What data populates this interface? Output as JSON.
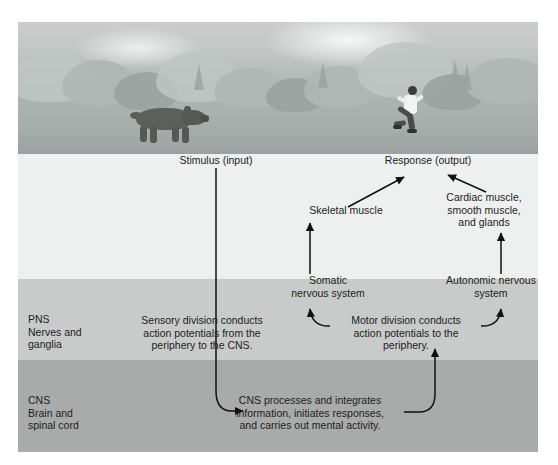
{
  "figure": {
    "scene": {
      "left_subject": "bear",
      "right_subject": "running person",
      "setting": "forest treeline with clouds"
    }
  },
  "bands": [
    {
      "key": "photo",
      "label": "",
      "sublabel_1": "",
      "sublabel_2": "",
      "color": "#b6bcba"
    },
    {
      "key": "light",
      "label": "",
      "sublabel_1": "",
      "sublabel_2": "",
      "color": "#eef0ef"
    },
    {
      "key": "pns",
      "label": "PNS",
      "sublabel_1": "Nerves and",
      "sublabel_2": "ganglia",
      "color": "#c8cbc9"
    },
    {
      "key": "cns",
      "label": "CNS",
      "sublabel_1": "Brain and",
      "sublabel_2": "spinal cord",
      "color": "#a8abaa"
    }
  ],
  "nodes": {
    "stimulus": "Stimulus (input)",
    "response": "Response (output)",
    "skeletal_muscle": "Skeletal muscle",
    "cardiac_line_1": "Cardiac muscle,",
    "cardiac_line_2": "smooth muscle,",
    "cardiac_line_3": "and glands",
    "somatic_line_1": "Somatic",
    "somatic_line_2": "nervous system",
    "autonomic_line_1": "Autonomic nervous",
    "autonomic_line_2": "system",
    "sensory_line_1": "Sensory division conducts",
    "sensory_line_2": "action potentials from the",
    "sensory_line_3": "periphery to the CNS.",
    "motor_line_1": "Motor division conducts",
    "motor_line_2": "action potentials to the",
    "motor_line_3": "periphery.",
    "cns_line_1": "CNS processes and integrates",
    "cns_line_2": "information, initiates responses,",
    "cns_line_3": "and carries out mental activity."
  },
  "connections": [
    {
      "from": "stimulus",
      "to": "cns_processes",
      "style": "line-then-curve-arrow"
    },
    {
      "from": "cns_processes",
      "to": "motor_division",
      "style": "curve-up-arrow"
    },
    {
      "from": "motor_division",
      "to": "somatic",
      "style": "curve-left-arrow"
    },
    {
      "from": "motor_division",
      "to": "autonomic",
      "style": "curve-right-arrow"
    },
    {
      "from": "somatic",
      "to": "skeletal_muscle",
      "style": "straight-up-arrow"
    },
    {
      "from": "autonomic",
      "to": "cardiac_glands",
      "style": "straight-up-arrow"
    },
    {
      "from": "skeletal_muscle",
      "to": "response",
      "style": "diagonal-arrow"
    },
    {
      "from": "cardiac_glands",
      "to": "response",
      "style": "diagonal-arrow"
    }
  ],
  "colors": {
    "band_pns": "#c8cbc9",
    "band_cns": "#a8abaa",
    "band_light": "#eef0ef",
    "text": "#1d1d1d",
    "connector": "#111111"
  }
}
